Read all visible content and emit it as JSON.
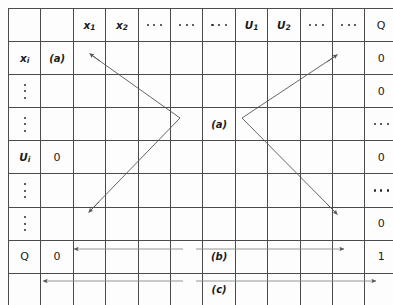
{
  "figure": {
    "type": "matrix-table-diagram",
    "grid": {
      "rows": 9,
      "cols": 12
    },
    "labels": {
      "a": "(a)",
      "b": "(b)",
      "c": "(c)",
      "zero": "0",
      "one": "1",
      "Q": "Q",
      "x1": "x",
      "x1_sub": "1",
      "x2": "x",
      "x2_sub": "2",
      "U1": "U",
      "U1_sub": "1",
      "U2": "U",
      "U2_sub": "2",
      "xi": "x",
      "xi_sub": "i",
      "Ui": "U",
      "Ui_sub": "i",
      "ellipsis": "···",
      "vdots": "⋮"
    },
    "header_row": [
      {
        "name": "corner-blank-1",
        "kind": "blank",
        "text": ""
      },
      {
        "name": "corner-blank-2",
        "kind": "blank",
        "text": ""
      },
      {
        "name": "header-x1",
        "kind": "var",
        "base": "x",
        "sub": "1"
      },
      {
        "name": "header-x2",
        "kind": "var",
        "base": "x",
        "sub": "2"
      },
      {
        "name": "header-hdots-1",
        "kind": "hdots",
        "text": "···"
      },
      {
        "name": "header-hdots-2",
        "kind": "hdots",
        "text": "···"
      },
      {
        "name": "header-hdots-3",
        "kind": "hdots",
        "text": "···"
      },
      {
        "name": "header-U1",
        "kind": "var",
        "base": "U",
        "sub": "1"
      },
      {
        "name": "header-U2",
        "kind": "var",
        "base": "U",
        "sub": "2"
      },
      {
        "name": "header-hdots-4",
        "kind": "hdots",
        "text": "···"
      },
      {
        "name": "header-hdots-5",
        "kind": "hdots",
        "text": "···"
      },
      {
        "name": "header-Q",
        "kind": "plain",
        "text": "Q"
      }
    ],
    "row_labels": [
      {
        "name": "row-label-xi",
        "kind": "var",
        "base": "x",
        "sub": "i"
      },
      {
        "name": "row-label-vdots-1",
        "kind": "vdots",
        "text": "⋮"
      },
      {
        "name": "row-label-vdots-2",
        "kind": "vdots",
        "text": "⋮"
      },
      {
        "name": "row-label-Ui",
        "kind": "var",
        "base": "U",
        "sub": "i"
      },
      {
        "name": "row-label-vdots-3",
        "kind": "vdots",
        "text": "⋮"
      },
      {
        "name": "row-label-vdots-4",
        "kind": "vdots",
        "text": "⋮"
      },
      {
        "name": "row-label-Q",
        "kind": "plain",
        "text": "Q"
      },
      {
        "name": "row-label-blank",
        "kind": "blank",
        "text": ""
      }
    ],
    "col2_values": [
      {
        "name": "cell-a-topleft",
        "kind": "paren",
        "text": "(a)"
      },
      {
        "name": "cell-blank",
        "kind": "blank",
        "text": ""
      },
      {
        "name": "cell-blank",
        "kind": "blank",
        "text": ""
      },
      {
        "name": "cell-zero-Ui",
        "kind": "plain",
        "text": "0"
      },
      {
        "name": "cell-blank",
        "kind": "blank",
        "text": ""
      },
      {
        "name": "cell-blank",
        "kind": "blank",
        "text": ""
      },
      {
        "name": "cell-zero-Q",
        "kind": "plain",
        "text": "0"
      },
      {
        "name": "cell-blank",
        "kind": "blank",
        "text": ""
      }
    ],
    "col_Q_values": [
      {
        "name": "cell-Q-zero-1",
        "kind": "plain",
        "text": "0"
      },
      {
        "name": "cell-Q-zero-2",
        "kind": "plain",
        "text": "0"
      },
      {
        "name": "cell-Q-hdots-1",
        "kind": "hdots",
        "text": "···"
      },
      {
        "name": "cell-Q-zero-3",
        "kind": "plain",
        "text": "0"
      },
      {
        "name": "cell-Q-hdots-2",
        "kind": "hdots",
        "text": "···"
      },
      {
        "name": "cell-Q-zero-4",
        "kind": "plain",
        "text": "0"
      },
      {
        "name": "cell-Q-one",
        "kind": "plain",
        "text": "1"
      },
      {
        "name": "cell-Q-blank",
        "kind": "blank",
        "text": ""
      }
    ],
    "center_label": {
      "name": "center-label-a",
      "text": "(a)"
    },
    "row_b_label": {
      "name": "row-b-label",
      "text": "(b)"
    },
    "row_c_label": {
      "name": "row-c-label",
      "text": "(c)"
    },
    "colors": {
      "grid_line": "#4a4a4a",
      "arrow": "#555555",
      "text": "#1b1b1b",
      "background": "#fdfdfd"
    },
    "annotations": [
      {
        "name": "arrow-chevron-left",
        "description": "left chevron arrow pointing up-left and down-left from vertex"
      },
      {
        "name": "arrow-chevron-right",
        "description": "right chevron arrow pointing up-right and down-right from vertex"
      },
      {
        "name": "arrow-b-left",
        "description": "horizontal arrow pointing left from (b)"
      },
      {
        "name": "arrow-b-right",
        "description": "horizontal arrow pointing right from (b) to 1"
      },
      {
        "name": "arrow-c-left",
        "description": "horizontal arrow pointing left from (c)"
      },
      {
        "name": "arrow-c-right",
        "description": "horizontal arrow pointing right from (c) to Q column"
      }
    ]
  }
}
